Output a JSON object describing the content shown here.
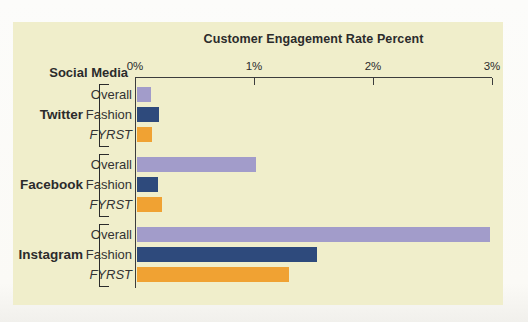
{
  "chart_data": {
    "type": "bar",
    "orientation": "horizontal",
    "title": "Customer Engagement Rate Percent",
    "group_axis_label": "Social Media",
    "value_axis": {
      "unit": "percent",
      "min": 0,
      "max": 3,
      "ticks": [
        "0%",
        "1%",
        "2%",
        "3%"
      ],
      "tick_values": [
        0,
        1,
        2,
        3
      ]
    },
    "series_labels": [
      "Overall",
      "Fashion",
      "FYRST"
    ],
    "groups": [
      {
        "label": "Twitter",
        "bars": [
          {
            "series": "Overall",
            "value": 0.12
          },
          {
            "series": "Fashion",
            "value": 0.19
          },
          {
            "series": "FYRST",
            "value": 0.13
          }
        ]
      },
      {
        "label": "Facebook",
        "bars": [
          {
            "series": "Overall",
            "value": 1.0
          },
          {
            "series": "Fashion",
            "value": 0.18
          },
          {
            "series": "FYRST",
            "value": 0.21
          }
        ]
      },
      {
        "label": "Instagram",
        "bars": [
          {
            "series": "Overall",
            "value": 2.97
          },
          {
            "series": "Fashion",
            "value": 1.52
          },
          {
            "series": "FYRST",
            "value": 1.28
          }
        ]
      }
    ],
    "colors": {
      "Overall": "#a29cca",
      "Fashion": "#2e4a7c",
      "FYRST": "#f0a233"
    },
    "panel_background": "#f0eecb",
    "axis_color": "#3c3c3c",
    "legend_position": "none",
    "grid": false
  }
}
